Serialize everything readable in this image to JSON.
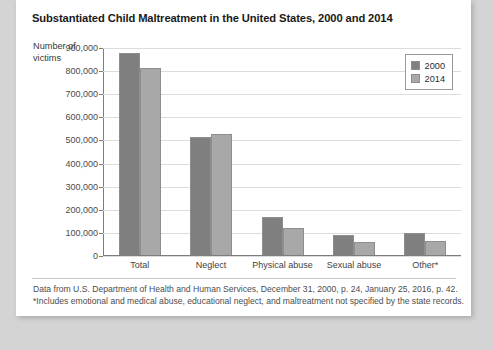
{
  "card": {
    "title": "Substantiated Child Maltreatment in the United States, 2000 and 2014",
    "axis_title": "Number of victims",
    "notes": [
      "Data from U.S. Department of Health and Human Services, December 31, 2000, p. 24, January 25, 2016, p. 42.",
      "*Includes emotional and medical abuse, educational neglect, and maltreatment not specified by the state records."
    ]
  },
  "colors": {
    "series_2000": "#7f7f7f",
    "series_2014": "#a8a8a8",
    "gridline": "#dcdcdc",
    "axis": "#7d7d7d",
    "card_background": "#ffffff",
    "page_background": "#d4d4d4"
  },
  "chart_data": {
    "type": "bar",
    "title": "Substantiated Child Maltreatment in the United States, 2000 and 2014",
    "xlabel": "",
    "ylabel": "Number of victims",
    "ylim": [
      0,
      900000
    ],
    "ytick_labels": [
      "900,000",
      "800,000",
      "700,000",
      "600,000",
      "500,000",
      "400,000",
      "300,000",
      "200,000",
      "100,000",
      "0"
    ],
    "ytick_values": [
      900000,
      800000,
      700000,
      600000,
      500000,
      400000,
      300000,
      200000,
      100000,
      0
    ],
    "grid": true,
    "legend_position": "top-right",
    "categories": [
      "Total",
      "Neglect",
      "Physical abuse",
      "Sexual abuse",
      "Other*"
    ],
    "series": [
      {
        "name": "2000",
        "values": [
          879000,
          512000,
          167000,
          88000,
          95000
        ]
      },
      {
        "name": "2014",
        "values": [
          815000,
          525000,
          119000,
          57000,
          60000
        ]
      }
    ]
  }
}
